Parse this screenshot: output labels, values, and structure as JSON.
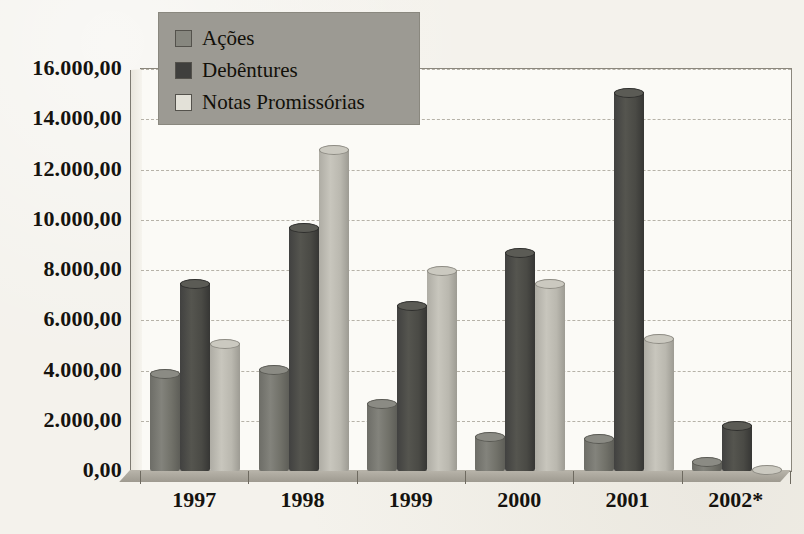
{
  "chart_data": {
    "type": "bar",
    "title": "",
    "xlabel": "",
    "ylabel": "",
    "categories": [
      "1997",
      "1998",
      "1999",
      "2000",
      "2001",
      "2002*"
    ],
    "series": [
      {
        "name": "Ações",
        "values": [
          3900,
          4050,
          2700,
          1400,
          1300,
          400
        ]
      },
      {
        "name": "Debêntures",
        "values": [
          7500,
          9700,
          6600,
          8700,
          15100,
          1850
        ]
      },
      {
        "name": "Notas Promissórias",
        "values": [
          5100,
          12800,
          8000,
          7500,
          5300,
          100
        ]
      }
    ],
    "ylim": [
      0,
      16000
    ],
    "ytick_values": [
      0,
      2000,
      4000,
      6000,
      8000,
      10000,
      12000,
      14000,
      16000
    ],
    "ytick_labels": [
      "0,00",
      "2.000,00",
      "4.000,00",
      "6.000,00",
      "8.000,00",
      "10.000,00",
      "12.000,00",
      "14.000,00",
      "16.000,00"
    ],
    "grid": true,
    "legend_position": "top-left",
    "style": "3d-cylinder-bars",
    "colors": {
      "acoes": "#7a7a73",
      "debentures": "#4a4a45",
      "notas": "#bab8af",
      "legend_background": "#9c9a93",
      "plot_background": "#fbfaf6",
      "page_background": "#f4f2ec",
      "gridline": "#b3afa4",
      "axis": "#6e6a60",
      "text": "#15130f"
    }
  },
  "legend": {
    "items": [
      {
        "label": "Ações",
        "swatch": "acoes-swatch"
      },
      {
        "label": "Debêntures",
        "swatch": "debentures-swatch"
      },
      {
        "label": "Notas Promissórias",
        "swatch": "notas-promissorias-swatch"
      }
    ]
  }
}
